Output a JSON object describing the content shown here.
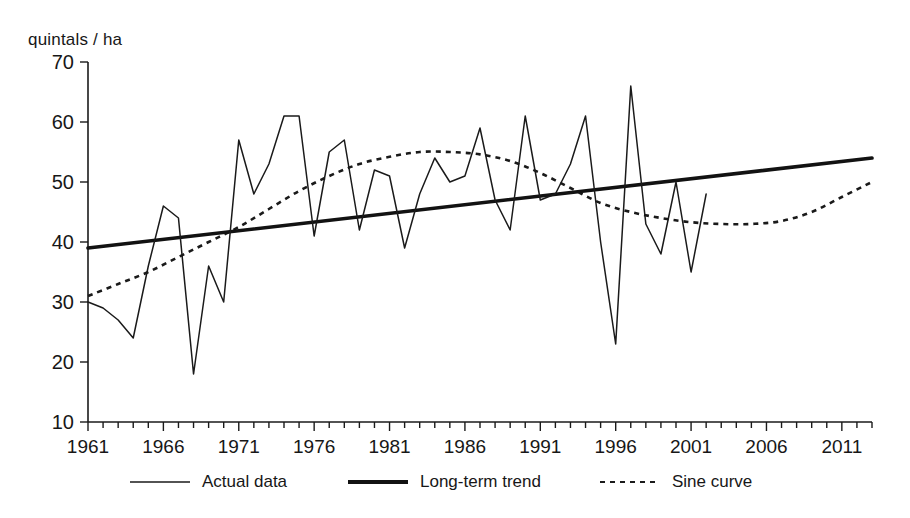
{
  "chart_data": {
    "type": "line",
    "title": "",
    "xlabel": "",
    "ylabel": "quintals / ha",
    "ylim": [
      10,
      70
    ],
    "xlim": [
      1961,
      2013
    ],
    "yticks": [
      10,
      20,
      30,
      40,
      50,
      60,
      70
    ],
    "xticks": [
      1961,
      1966,
      1971,
      1976,
      1981,
      1986,
      1991,
      1996,
      2001,
      2006,
      2011
    ],
    "xtick_minor_step": 1,
    "grid": false,
    "legend_position": "bottom",
    "series": [
      {
        "name": "Actual data",
        "style": "thin-solid",
        "color": "#1a1a1a",
        "x": [
          1961,
          1962,
          1963,
          1964,
          1965,
          1966,
          1967,
          1968,
          1969,
          1970,
          1971,
          1972,
          1973,
          1974,
          1975,
          1976,
          1977,
          1978,
          1979,
          1980,
          1981,
          1982,
          1983,
          1984,
          1985,
          1986,
          1987,
          1988,
          1989,
          1990,
          1991,
          1992,
          1993,
          1994,
          1995,
          1996,
          1997,
          1998,
          1999,
          2000,
          2001,
          2002
        ],
        "values": [
          30,
          29,
          27,
          24,
          36,
          46,
          44,
          18,
          36,
          30,
          57,
          48,
          53,
          61,
          61,
          41,
          55,
          57,
          42,
          52,
          51,
          39,
          48,
          54,
          50,
          51,
          59,
          47,
          42,
          61,
          47,
          48,
          53,
          61,
          40,
          23,
          66,
          43,
          38,
          50,
          35,
          48
        ]
      },
      {
        "name": "Long-term trend",
        "style": "thick-solid",
        "color": "#121212",
        "x": [
          1961,
          2013
        ],
        "values": [
          39,
          54
        ]
      },
      {
        "name": "Sine curve",
        "style": "dashed",
        "color": "#1a1a1a",
        "x": [
          1961,
          1963,
          1965,
          1967,
          1969,
          1971,
          1973,
          1975,
          1977,
          1979,
          1981,
          1983,
          1985,
          1987,
          1989,
          1991,
          1993,
          1995,
          1997,
          1999,
          2001,
          2003,
          2005,
          2007,
          2009,
          2011,
          2013
        ],
        "values": [
          31,
          33,
          35,
          37.5,
          40,
          42.5,
          45.5,
          48.5,
          51,
          53,
          54.2,
          55,
          55,
          54.6,
          53.5,
          51.5,
          49,
          46.5,
          45,
          44,
          43.3,
          43,
          43,
          43.5,
          45,
          47.5,
          50
        ]
      }
    ]
  },
  "legend": {
    "items": [
      {
        "label": "Actual data",
        "style": "thin-solid"
      },
      {
        "label": "Long-term trend",
        "style": "thick-solid"
      },
      {
        "label": "Sine curve",
        "style": "dashed"
      }
    ]
  },
  "axis": {
    "unit_label": "quintals / ha"
  }
}
